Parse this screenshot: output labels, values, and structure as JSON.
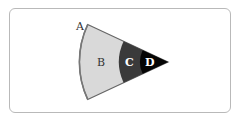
{
  "diagram": {
    "type": "sector-bands",
    "apex": [
      168,
      62
    ],
    "half_angle_deg": 25,
    "regions": [
      {
        "id": "B",
        "label": "B",
        "inner_r": 49,
        "outer_r": 88.6,
        "fill": "#d9d9d9",
        "label_color": "#333333",
        "label_pos": [
          100,
          66
        ]
      },
      {
        "id": "C",
        "label": "C",
        "inner_r": 28,
        "outer_r": 49,
        "fill": "#3a3a3a",
        "label_color": "#ffffff",
        "label_pos": [
          130,
          66
        ]
      },
      {
        "id": "D",
        "label": "D",
        "inner_r": 0,
        "outer_r": 28,
        "fill": "#050505",
        "label_color": "#ffffff",
        "label_pos": [
          149,
          66
        ]
      }
    ],
    "outer_edge_label": {
      "text": "A",
      "pos": [
        76,
        28
      ],
      "color": "#333333"
    },
    "edge_color": "#666666"
  }
}
